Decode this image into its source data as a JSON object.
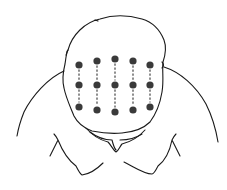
{
  "figure": {
    "colors": {
      "line": "#1a1a1a",
      "dot": "#3a3a3a",
      "dash": "#444444",
      "background": "#ffffff"
    },
    "dot_radius": 3.6,
    "columns": [
      {
        "x": 79,
        "points_y": [
          65,
          85,
          107
        ]
      },
      {
        "x": 97,
        "points_y": [
          61,
          85,
          110
        ]
      },
      {
        "x": 115,
        "points_y": [
          59,
          85,
          112
        ]
      },
      {
        "x": 133,
        "points_y": [
          61,
          85,
          110
        ]
      },
      {
        "x": 150,
        "points_y": [
          65,
          85,
          107
        ]
      }
    ]
  }
}
